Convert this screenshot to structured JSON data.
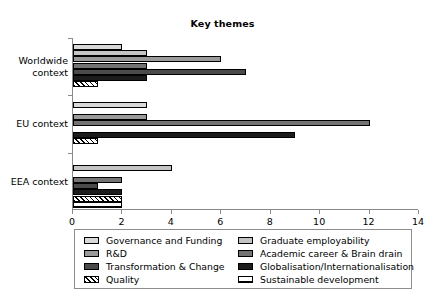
{
  "chart_data": {
    "type": "bar",
    "orientation": "horizontal",
    "title": "Key themes",
    "xlabel": "",
    "ylabel": "",
    "xlim": [
      0,
      14
    ],
    "xticks": [
      0,
      2,
      4,
      6,
      8,
      10,
      12,
      14
    ],
    "grid": false,
    "legend_position": "bottom",
    "categories": [
      "Worldwide context",
      "EU context",
      "EEA context"
    ],
    "series": [
      {
        "name": "Governance and Funding",
        "color": "#d9d9d9",
        "pattern": "solid",
        "values": [
          2,
          3,
          0
        ]
      },
      {
        "name": "Graduate employability",
        "color": "#c4c4c4",
        "pattern": "solid",
        "values": [
          3,
          0,
          4
        ]
      },
      {
        "name": "R&D",
        "color": "#9a9a9a",
        "pattern": "solid",
        "values": [
          6,
          3,
          0
        ]
      },
      {
        "name": "Academic career & Brain drain",
        "color": "#737373",
        "pattern": "solid",
        "values": [
          3,
          12,
          2
        ]
      },
      {
        "name": "Transformation & Change",
        "color": "#4a4a4a",
        "pattern": "solid",
        "values": [
          7,
          0,
          1
        ]
      },
      {
        "name": "Globalisation/Internationalisation",
        "color": "#1c1c1c",
        "pattern": "solid",
        "values": [
          3,
          9,
          2
        ]
      },
      {
        "name": "Quality",
        "color": "#ffffff",
        "pattern": "diagonal",
        "values": [
          1,
          1,
          2
        ]
      },
      {
        "name": "Sustainable development",
        "color": "#ffffff",
        "pattern": "crosshatch",
        "values": [
          0,
          0,
          2
        ]
      }
    ]
  },
  "axis": {
    "tick_labels": [
      "0",
      "2",
      "4",
      "6",
      "8",
      "10",
      "12",
      "14"
    ],
    "category_labels": [
      "Worldwide\ncontext",
      "EU context",
      "EEA context"
    ]
  },
  "legend": {
    "left_column": [
      "Governance and Funding",
      "R&D",
      "Transformation & Change",
      "Quality"
    ],
    "right_column": [
      "Graduate employability",
      "Academic career & Brain drain",
      "Globalisation/Internationalisation",
      "Sustainable development"
    ]
  }
}
